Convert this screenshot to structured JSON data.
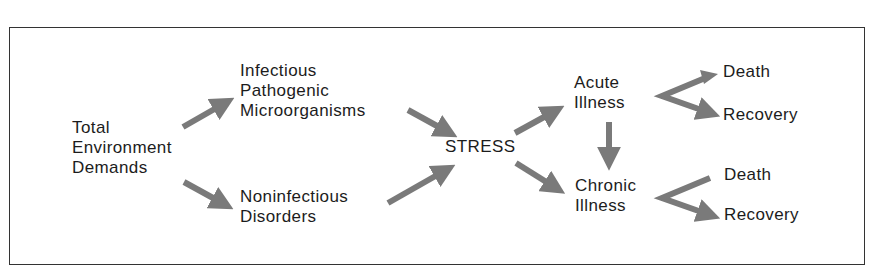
{
  "diagram": {
    "nodes": {
      "total": [
        "Total",
        "Environment",
        "Demands"
      ],
      "infectious": [
        "Infectious",
        "Pathogenic",
        "Microorganisms"
      ],
      "noninfectious": [
        "Noninfectious",
        "Disorders"
      ],
      "stress": [
        "STRESS"
      ],
      "acute": [
        "Acute",
        "Illness"
      ],
      "chronic": [
        "Chronic",
        "Illness"
      ],
      "acute_death": [
        "Death"
      ],
      "acute_recovery": [
        "Recovery"
      ],
      "chronic_death": [
        "Death"
      ],
      "chronic_recovery": [
        "Recovery"
      ]
    },
    "edges": [
      {
        "from": "Total Environment Demands",
        "to": "Infectious Pathogenic Microorganisms"
      },
      {
        "from": "Total Environment Demands",
        "to": "Noninfectious Disorders"
      },
      {
        "from": "Infectious Pathogenic Microorganisms",
        "to": "STRESS"
      },
      {
        "from": "Noninfectious Disorders",
        "to": "STRESS"
      },
      {
        "from": "STRESS",
        "to": "Acute Illness"
      },
      {
        "from": "STRESS",
        "to": "Chronic Illness"
      },
      {
        "from": "Acute Illness",
        "to": "Chronic Illness"
      },
      {
        "from": "Acute Illness",
        "to": "Death"
      },
      {
        "from": "Acute Illness",
        "to": "Recovery"
      },
      {
        "from": "Chronic Illness",
        "to": "Death"
      },
      {
        "from": "Chronic Illness",
        "to": "Recovery"
      }
    ],
    "colors": {
      "arrow": "#7a7a7a",
      "text": "#1c1c1c",
      "border": "#333333"
    }
  }
}
